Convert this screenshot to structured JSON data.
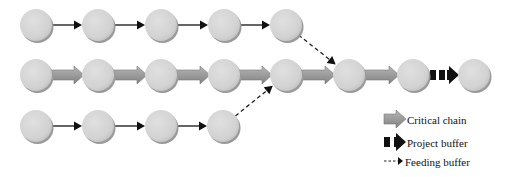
{
  "diagram": {
    "title": "",
    "colors": {
      "node_fill": "#d4d4d4",
      "node_shadow": "#9a9a9a",
      "critical_chain": "#9c9c9c",
      "critical_chain_edge": "#7a7a7a",
      "project_buffer": "#111111",
      "arrow": "#111111",
      "feeding_buffer": "#222222"
    },
    "nodes": [
      {
        "id": "t1",
        "row": "top",
        "x": 36,
        "y": 25
      },
      {
        "id": "t2",
        "row": "top",
        "x": 98,
        "y": 25
      },
      {
        "id": "t3",
        "row": "top",
        "x": 161,
        "y": 25
      },
      {
        "id": "t4",
        "row": "top",
        "x": 224,
        "y": 25
      },
      {
        "id": "t5",
        "row": "top",
        "x": 286,
        "y": 25
      },
      {
        "id": "m1",
        "row": "middle",
        "x": 36,
        "y": 75
      },
      {
        "id": "m2",
        "row": "middle",
        "x": 98,
        "y": 75
      },
      {
        "id": "m3",
        "row": "middle",
        "x": 161,
        "y": 75
      },
      {
        "id": "m4",
        "row": "middle",
        "x": 224,
        "y": 75
      },
      {
        "id": "m5",
        "row": "middle",
        "x": 286,
        "y": 75
      },
      {
        "id": "m6",
        "row": "middle",
        "x": 349,
        "y": 75
      },
      {
        "id": "m7",
        "row": "middle",
        "x": 413,
        "y": 75
      },
      {
        "id": "m8",
        "row": "middle",
        "x": 474,
        "y": 75
      },
      {
        "id": "b1",
        "row": "bottom",
        "x": 36,
        "y": 126
      },
      {
        "id": "b2",
        "row": "bottom",
        "x": 98,
        "y": 126
      },
      {
        "id": "b3",
        "row": "bottom",
        "x": 161,
        "y": 126
      },
      {
        "id": "b4",
        "row": "bottom",
        "x": 223,
        "y": 126
      }
    ],
    "edges": [
      {
        "from": "t1",
        "to": "t2",
        "type": "task"
      },
      {
        "from": "t2",
        "to": "t3",
        "type": "task"
      },
      {
        "from": "t3",
        "to": "t4",
        "type": "task"
      },
      {
        "from": "t4",
        "to": "t5",
        "type": "task"
      },
      {
        "from": "t5",
        "to": "m6",
        "type": "feeding_buffer"
      },
      {
        "from": "m1",
        "to": "m2",
        "type": "critical_chain"
      },
      {
        "from": "m2",
        "to": "m3",
        "type": "critical_chain"
      },
      {
        "from": "m3",
        "to": "m4",
        "type": "critical_chain"
      },
      {
        "from": "m4",
        "to": "m5",
        "type": "critical_chain"
      },
      {
        "from": "m5",
        "to": "m6",
        "type": "critical_chain"
      },
      {
        "from": "m6",
        "to": "m7",
        "type": "critical_chain"
      },
      {
        "from": "m7",
        "to": "m8",
        "type": "project_buffer"
      },
      {
        "from": "b1",
        "to": "b2",
        "type": "task"
      },
      {
        "from": "b2",
        "to": "b3",
        "type": "task"
      },
      {
        "from": "b3",
        "to": "b4",
        "type": "task"
      },
      {
        "from": "b4",
        "to": "m5",
        "type": "feeding_buffer"
      }
    ],
    "legend": {
      "items": [
        {
          "type": "critical_chain",
          "label": "Critical chain"
        },
        {
          "type": "project_buffer",
          "label": "Project buffer"
        },
        {
          "type": "feeding_buffer",
          "label": "Feeding buffer"
        }
      ]
    }
  }
}
